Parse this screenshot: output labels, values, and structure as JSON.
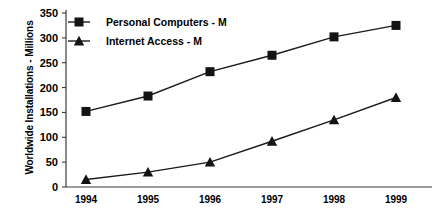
{
  "chart_data": {
    "type": "line",
    "title": "",
    "xlabel": "",
    "ylabel": "Worldwide Installations - Millions",
    "categories": [
      "1994",
      "1995",
      "1996",
      "1997",
      "1998",
      "1999"
    ],
    "ylim": [
      0,
      350
    ],
    "ytick_labels": [
      "0",
      "50",
      "100",
      "150",
      "200",
      "250",
      "300",
      "350"
    ],
    "ytick_values": [
      0,
      50,
      100,
      150,
      200,
      250,
      300,
      350
    ],
    "grid": false,
    "legend_position": "top-left-inside",
    "series": [
      {
        "name": "Personal Computers - M",
        "marker": "square",
        "color": "#141414",
        "values": [
          152,
          183,
          232,
          265,
          302,
          325
        ]
      },
      {
        "name": "Internet Access - M",
        "marker": "triangle",
        "color": "#141414",
        "values": [
          15,
          30,
          50,
          92,
          135,
          180
        ]
      }
    ]
  },
  "legend": {
    "items": [
      {
        "label": "Personal Computers - M",
        "marker": "square"
      },
      {
        "label": "Internet Access - M",
        "marker": "triangle"
      }
    ]
  }
}
